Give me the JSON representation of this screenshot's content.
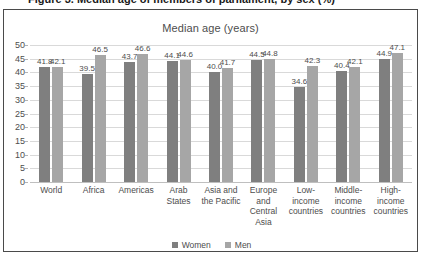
{
  "caption": {
    "text": "Figure 3. Median age of members of parliament, by sex (%)"
  },
  "legend": {
    "position": "bottom-center",
    "items": [
      {
        "label": "Women",
        "color": "#7f7f7f",
        "swatch": "square-swatch"
      },
      {
        "label": "Men",
        "color": "#a6a6a6",
        "swatch": "square-swatch"
      }
    ]
  },
  "chart_data": {
    "type": "bar",
    "title": "Median age (years)",
    "xlabel": "",
    "ylabel": "",
    "ylim": [
      0,
      50
    ],
    "ytick_step": 5,
    "yticks": [
      0,
      5,
      10,
      15,
      20,
      25,
      30,
      35,
      40,
      45,
      50
    ],
    "grid": true,
    "categories": [
      "World",
      "Africa",
      "Americas",
      "Arab States",
      "Asia and the Pacific",
      "Europe and Central Asia",
      "Low-income countries",
      "Middle-income countries",
      "High-income countries"
    ],
    "category_lines": [
      [
        "World"
      ],
      [
        "Africa"
      ],
      [
        "Americas"
      ],
      [
        "Arab",
        "States"
      ],
      [
        "Asia and",
        "the Pacific"
      ],
      [
        "Europe",
        "and",
        "Central",
        "Asia"
      ],
      [
        "Low-",
        "income",
        "countries"
      ],
      [
        "Middle-",
        "income",
        "countries"
      ],
      [
        "High-",
        "income",
        "countries"
      ]
    ],
    "series": [
      {
        "name": "Women",
        "color": "#7f7f7f",
        "values": [
          41.8,
          39.5,
          43.7,
          44.1,
          40.0,
          44.5,
          34.6,
          40.4,
          44.9
        ]
      },
      {
        "name": "Men",
        "color": "#a6a6a6",
        "values": [
          42.1,
          46.5,
          46.6,
          44.6,
          41.7,
          44.8,
          42.3,
          42.1,
          47.1
        ]
      }
    ]
  }
}
